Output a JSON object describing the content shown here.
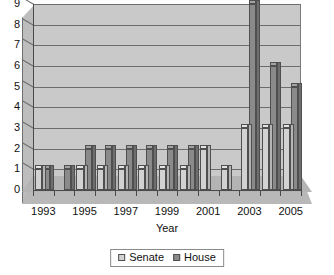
{
  "chart_data": {
    "type": "bar",
    "title": "",
    "subtitle": "",
    "xlabel": "Year",
    "ylabel": "",
    "categories": [
      "1993",
      "1994",
      "1995",
      "1996",
      "1997",
      "1998",
      "1999",
      "2000",
      "2001",
      "2002",
      "2003",
      "2004",
      "2005"
    ],
    "tick_labels_shown": [
      "1993",
      "1995",
      "1997",
      "1999",
      "2001",
      "2003",
      "2005"
    ],
    "series": [
      {
        "name": "Senate",
        "color": "#d2d2d2",
        "values": [
          1,
          0,
          1,
          1,
          1,
          1,
          1,
          1,
          2,
          1,
          3,
          3,
          3
        ]
      },
      {
        "name": "House",
        "color": "#8a8a8a",
        "values": [
          1,
          1,
          2,
          2,
          2,
          2,
          2,
          2,
          0,
          0,
          9,
          6,
          5
        ]
      }
    ],
    "ylim": [
      0,
      9
    ],
    "yticks": [
      0,
      1,
      2,
      3,
      4,
      5,
      6,
      7,
      8,
      9
    ],
    "grid": true,
    "legend_position": "bottom",
    "style": "3d-clustered-column"
  },
  "axis": {
    "y_tick_labels": [
      "9",
      "8",
      "7",
      "6",
      "5",
      "4",
      "3",
      "2",
      "1",
      "0"
    ],
    "x_tick_labels": [
      "1993",
      "1995",
      "1997",
      "1999",
      "2001",
      "2003",
      "2005"
    ],
    "x_title": "Year"
  },
  "legend": {
    "items": [
      {
        "label": "Senate",
        "color": "#d2d2d2"
      },
      {
        "label": "House",
        "color": "#8a8a8a"
      }
    ]
  }
}
